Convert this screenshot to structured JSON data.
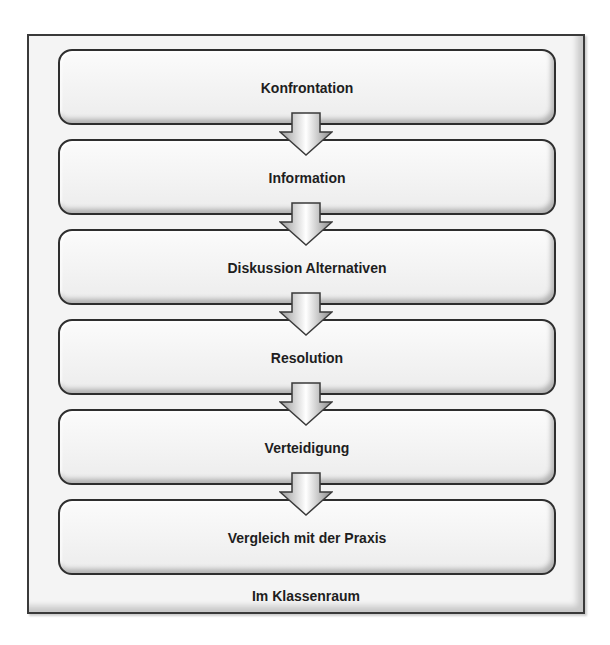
{
  "diagram": {
    "steps": [
      {
        "label": "Konfrontation"
      },
      {
        "label": "Information"
      },
      {
        "label": "Diskussion Alternativen"
      },
      {
        "label": "Resolution"
      },
      {
        "label": "Verteidigung"
      },
      {
        "label": "Vergleich mit der Praxis"
      }
    ],
    "container_label": "Im Klassenraum",
    "arrow_icon": "down-arrow-icon",
    "colors": {
      "border": "#2e2e2e",
      "box_fill": "#f4f4f4",
      "text": "#1e1e1e"
    }
  }
}
